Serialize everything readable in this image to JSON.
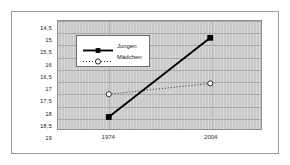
{
  "chart_data": {
    "type": "line",
    "title": "",
    "xlabel": "",
    "ylabel": "Zeit in Sekunden",
    "categories": [
      "1974",
      "2004"
    ],
    "x": [
      1974,
      2004
    ],
    "yticks": [
      "14,5",
      "15",
      "15,5",
      "16",
      "16,5",
      "17",
      "17,5",
      "18",
      "18,5",
      "19"
    ],
    "ytick_values": [
      14.5,
      15,
      15.5,
      16,
      16.5,
      17,
      17.5,
      18,
      18.5,
      19
    ],
    "ylim": [
      14.5,
      19
    ],
    "y_inverted": true,
    "grid": true,
    "legend_position": "top-left-inset",
    "series": [
      {
        "name": "Jungen",
        "values": [
          18.5,
          15.2
        ],
        "line_style": "solid",
        "marker": "filled-square",
        "color": "#000000"
      },
      {
        "name": "Mädchen",
        "values": [
          17.55,
          17.1
        ],
        "line_style": "dotted",
        "marker": "open-circle",
        "color": "#2b2b2b"
      }
    ]
  },
  "style": {
    "plot_background": "#c9c9c9",
    "gridline_color": "#a8a8a8",
    "frame_border": "#9a9a9a",
    "legend_background": "#ffffff",
    "text_color": "#1a1a1a"
  }
}
